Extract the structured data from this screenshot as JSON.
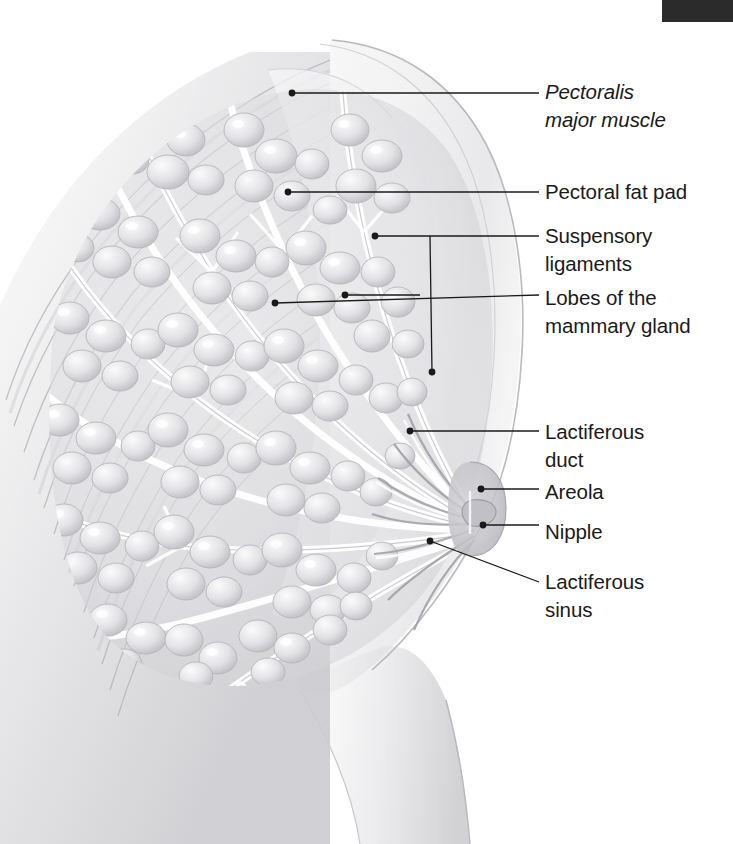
{
  "figure": {
    "background_color": "#ffffff",
    "ink_color": "#1a1a1a",
    "corner_bar_color": "#2b2b2b",
    "skin_tone": "#e9e9ea",
    "muscle_tone": "#d8d8da",
    "gland_tone": "#dcdcde",
    "areola_tone": "#c9c9cc"
  },
  "labels": [
    {
      "id": "pectoralis-major-muscle",
      "text": "Pectoralis\nmajor muscle",
      "style": "italic",
      "x": 545,
      "y": 78,
      "leader": {
        "type": "straight",
        "dot": [
          292,
          93
        ],
        "elbow": [
          539,
          93
        ]
      }
    },
    {
      "id": "pectoral-fat-pad",
      "text": "Pectoral fat pad",
      "style": "normal",
      "x": 545,
      "y": 178,
      "leader": {
        "type": "straight",
        "dot": [
          288,
          192
        ],
        "elbow": [
          539,
          192
        ]
      }
    },
    {
      "id": "suspensory-ligaments",
      "text": "Suspensory\nligaments",
      "style": "normal",
      "x": 545,
      "y": 222,
      "leader": {
        "type": "branched",
        "dot": [
          375,
          236
        ],
        "dot2": [
          432,
          372
        ],
        "elbow": [
          539,
          236
        ],
        "branch": [
          430,
          236
        ]
      }
    },
    {
      "id": "lobes-of-the-mammary-gland",
      "text": "Lobes of the\nmammary gland",
      "style": "normal",
      "x": 545,
      "y": 284,
      "leader": {
        "type": "branched",
        "dot": [
          275,
          303
        ],
        "dot2": [
          345,
          295
        ],
        "elbow": [
          539,
          295
        ],
        "branch": [
          420,
          295
        ]
      }
    },
    {
      "id": "lactiferous-duct",
      "text": "Lactiferous\nduct",
      "style": "normal",
      "x": 545,
      "y": 418,
      "leader": {
        "type": "straight",
        "dot": [
          410,
          431
        ],
        "elbow": [
          539,
          431
        ]
      }
    },
    {
      "id": "areola",
      "text": "Areola",
      "style": "normal",
      "x": 545,
      "y": 478,
      "leader": {
        "type": "straight",
        "dot": [
          481,
          489
        ],
        "elbow": [
          539,
          489
        ]
      }
    },
    {
      "id": "nipple",
      "text": "Nipple",
      "style": "normal",
      "x": 545,
      "y": 518,
      "leader": {
        "type": "straight",
        "dot": [
          483,
          525
        ],
        "elbow": [
          539,
          525
        ]
      }
    },
    {
      "id": "lactiferous-sinus",
      "text": "Lactiferous\nsinus",
      "style": "normal",
      "x": 545,
      "y": 568,
      "leader": {
        "type": "straight",
        "dot": [
          430,
          541
        ],
        "elbow": [
          539,
          582
        ]
      }
    }
  ],
  "corner_bar": {
    "x": 662,
    "y": 0,
    "width": 71,
    "height": 22
  },
  "structures": [
    {
      "name": "pectoralis-major-muscle",
      "description": "diagonal striated muscle fibers filling the upper-left chest wall"
    },
    {
      "name": "pectoral-fat-pad",
      "description": "pale fat layer between muscle and glandular tissue"
    },
    {
      "name": "suspensory-ligaments",
      "description": "Cooper's ligaments, fibrous strands radiating from chest wall to skin"
    },
    {
      "name": "mammary-lobes",
      "description": "clusters of grape-like glandular lobules arranged in radial wedges"
    },
    {
      "name": "lactiferous-ducts",
      "description": "branching duct tree converging toward the nipple"
    },
    {
      "name": "lactiferous-sinus",
      "description": "widened duct segments just behind the nipple"
    },
    {
      "name": "areola",
      "description": "darker circular pigmented region around the nipple"
    },
    {
      "name": "nipple",
      "description": "central protrusion at the breast apex"
    },
    {
      "name": "skin-contour",
      "description": "outer breast and torso profile line"
    }
  ]
}
